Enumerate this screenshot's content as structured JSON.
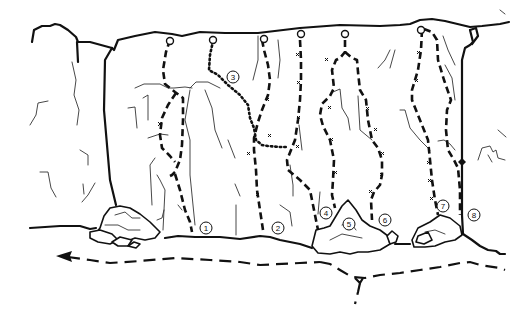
{
  "diagram": {
    "type": "climbing-topo",
    "background": "#ffffff",
    "ink": "#111111",
    "route_labels": [
      {
        "id": 1,
        "label": "1",
        "x": 206,
        "y": 228
      },
      {
        "id": 2,
        "label": "2",
        "x": 278,
        "y": 228
      },
      {
        "id": 3,
        "label": "3",
        "x": 233,
        "y": 77
      },
      {
        "id": 4,
        "label": "4",
        "x": 326,
        "y": 213
      },
      {
        "id": 5,
        "label": "5",
        "x": 349,
        "y": 224
      },
      {
        "id": 6,
        "label": "6",
        "x": 385,
        "y": 220
      },
      {
        "id": 7,
        "label": "7",
        "x": 443,
        "y": 206
      },
      {
        "id": 8,
        "label": "8",
        "x": 474,
        "y": 215
      }
    ],
    "legend": {
      "lower_off_anchor": "open circle",
      "bolt": "x",
      "approach_path": "long dashed line with arrow"
    }
  }
}
